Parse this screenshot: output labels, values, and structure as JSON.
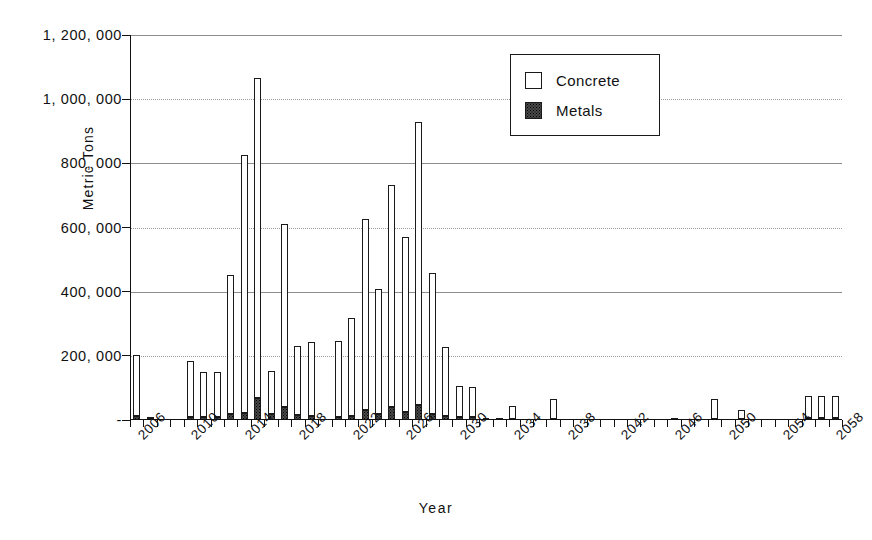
{
  "chart_data": {
    "type": "bar",
    "title": "",
    "subtitle": "",
    "xlabel": "Year",
    "ylabel": "Metric Tons",
    "stacked": true,
    "grid": true,
    "legend_position": "top-right",
    "ylim": [
      0,
      1200000
    ],
    "ytick_labels": [
      "1, 200, 000",
      "1, 000, 000",
      "800, 000",
      "600, 000",
      "400, 000",
      "200, 000",
      "-"
    ],
    "ytick_values": [
      1200000,
      1000000,
      800000,
      600000,
      400000,
      200000,
      0
    ],
    "xtick_labels": [
      "2006",
      "2010",
      "2014",
      "2018",
      "2022",
      "2026",
      "2030",
      "2034",
      "2038",
      "2042",
      "2046",
      "2050",
      "2054",
      "2058"
    ],
    "x_first": 2006,
    "x_last": 2058,
    "categories": [
      2006,
      2007,
      2008,
      2009,
      2010,
      2011,
      2012,
      2013,
      2014,
      2015,
      2016,
      2017,
      2018,
      2019,
      2020,
      2021,
      2022,
      2023,
      2024,
      2025,
      2026,
      2027,
      2028,
      2029,
      2030,
      2031,
      2032,
      2033,
      2034,
      2035,
      2036,
      2037,
      2038,
      2039,
      2040,
      2041,
      2042,
      2043,
      2044,
      2045,
      2046,
      2047,
      2048,
      2049,
      2050,
      2051,
      2052,
      2053,
      2054,
      2055,
      2056,
      2057,
      2058
    ],
    "series": [
      {
        "name": "Concrete",
        "color": "#ffffff",
        "values": [
          190000,
          8000,
          0,
          0,
          175000,
          142000,
          140000,
          435000,
          805000,
          995000,
          135000,
          570000,
          215000,
          230000,
          0,
          235000,
          305000,
          595000,
          390000,
          690000,
          545000,
          880000,
          440000,
          215000,
          95000,
          95000,
          6000,
          6000,
          40000,
          0,
          0,
          60000,
          0,
          0,
          0,
          0,
          0,
          0,
          0,
          0,
          6000,
          0,
          0,
          60000,
          0,
          30000,
          0,
          0,
          0,
          0,
          70000,
          70000,
          70000
        ]
      },
      {
        "name": "Metals",
        "color": "#4a4a4a",
        "values": [
          12000,
          2000,
          0,
          0,
          10000,
          9000,
          9000,
          18000,
          22000,
          70000,
          18000,
          42000,
          16000,
          14000,
          0,
          10000,
          14000,
          32000,
          18000,
          42000,
          25000,
          48000,
          18000,
          14000,
          10000,
          8000,
          1000,
          1000,
          4000,
          0,
          0,
          4000,
          0,
          0,
          0,
          0,
          0,
          0,
          0,
          0,
          1000,
          0,
          0,
          4000,
          0,
          2000,
          0,
          0,
          0,
          0,
          5000,
          5000,
          5000
        ]
      }
    ],
    "totals": [
      202000,
      10000,
      0,
      0,
      185000,
      151000,
      149000,
      453000,
      827000,
      1065000,
      153000,
      612000,
      231000,
      244000,
      0,
      245000,
      319000,
      627000,
      408000,
      732000,
      570000,
      928000,
      458000,
      229000,
      105000,
      103000,
      7000,
      7000,
      44000,
      0,
      0,
      64000,
      0,
      0,
      0,
      0,
      0,
      0,
      0,
      0,
      7000,
      0,
      0,
      64000,
      0,
      32000,
      0,
      0,
      0,
      0,
      75000,
      75000,
      75000
    ]
  },
  "legend": {
    "items": [
      {
        "label": "Concrete",
        "swatch": "concrete-swatch"
      },
      {
        "label": "Metals",
        "swatch": "metals-swatch"
      }
    ]
  },
  "axis": {
    "y_title": "Metric Tons",
    "x_title": "Year"
  }
}
